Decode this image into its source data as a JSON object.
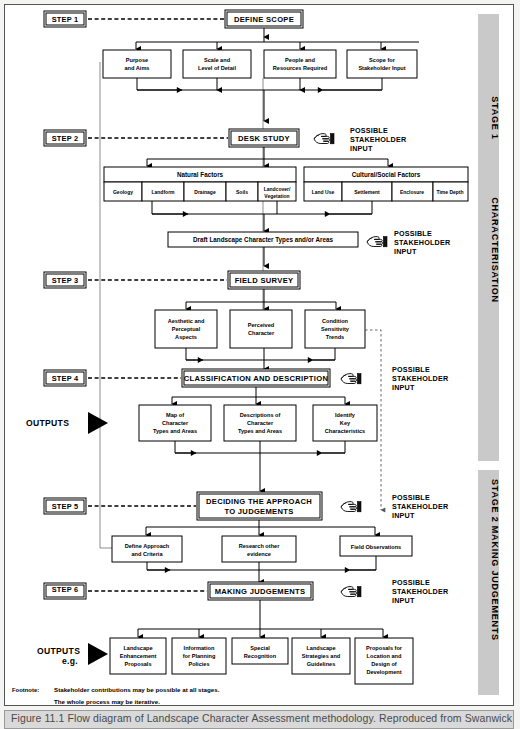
{
  "figure": {
    "caption": "Figure 11.1  Flow diagram of Landscape Character Assessment methodology.  Reproduced from Swanwick &"
  },
  "stages": [
    {
      "id": "stage-1",
      "label": "STAGE 1          CHARACTERISATION"
    },
    {
      "id": "stage-2",
      "label": "STAGE 2 MAKING JUDGEMENTS"
    }
  ],
  "stage_labels": {
    "stage1_a": "STAGE 1",
    "stage1_b": "CHARACTERISATION",
    "stage2": "STAGE 2 MAKING JUDGEMENTS"
  },
  "steps": [
    {
      "id": "step-1",
      "label": "STEP 1",
      "title": "DEFINE SCOPE"
    },
    {
      "id": "step-2",
      "label": "STEP 2",
      "title": "DESK STUDY"
    },
    {
      "id": "step-3",
      "label": "STEP 3",
      "title": "FIELD SURVEY"
    },
    {
      "id": "step-4",
      "label": "STEP 4",
      "title": "CLASSIFICATION AND DESCRIPTION"
    },
    {
      "id": "step-5",
      "label": "STEP 5",
      "title": "DECIDING THE APPROACH TO JUDGEMENTS"
    },
    {
      "id": "step-6",
      "label": "STEP 6",
      "title": "MAKING JUDGEMENTS"
    }
  ],
  "titles": {
    "define_scope": "DEFINE SCOPE",
    "desk_study": "DESK STUDY",
    "field_survey": "FIELD SURVEY",
    "classification": "CLASSIFICATION AND DESCRIPTION",
    "deciding_l1": "DECIDING THE APPROACH",
    "deciding_l2": "TO JUDGEMENTS",
    "making_judgements": "MAKING JUDGEMENTS"
  },
  "step1_boxes": [
    {
      "l1": "Purpose",
      "l2": "and Aims"
    },
    {
      "l1": "Scale and",
      "l2": "Level of Detail"
    },
    {
      "l1": "People and",
      "l2": "Resources Required"
    },
    {
      "l1": "Scope for",
      "l2": "Stakeholder Input"
    }
  ],
  "factors": {
    "natural_header": "Natural Factors",
    "natural_items": [
      {
        "l1": "Geology",
        "l2": ""
      },
      {
        "l1": "Landform",
        "l2": ""
      },
      {
        "l1": "Drainage",
        "l2": ""
      },
      {
        "l1": "Soils",
        "l2": ""
      },
      {
        "l1": "Landcover/",
        "l2": "Vegetation"
      }
    ],
    "cultural_header": "Cultural/Social Factors",
    "cultural_items": [
      {
        "l1": "Land Use",
        "l2": ""
      },
      {
        "l1": "Settlement",
        "l2": ""
      },
      {
        "l1": "Enclosure",
        "l2": ""
      },
      {
        "l1": "Time Depth",
        "l2": ""
      }
    ]
  },
  "draft_box": "Draft Landscape Character Types and/or Areas",
  "step3_boxes": [
    {
      "l1": "Aesthetic and",
      "l2": "Perceptual",
      "l3": "Aspects"
    },
    {
      "l1": "Perceived",
      "l2": "Character",
      "l3": ""
    },
    {
      "l1": "Condition",
      "l2": "Sensitivity",
      "l3": "Trends"
    }
  ],
  "step4_boxes": [
    {
      "l1": "Map of",
      "l2": "Character",
      "l3": "Types and Areas"
    },
    {
      "l1": "Descriptions of",
      "l2": "Character",
      "l3": "Types and Areas"
    },
    {
      "l1": "Identify",
      "l2": "Key",
      "l3": "Characteristics"
    }
  ],
  "step5_boxes": [
    {
      "l1": "Define Approach",
      "l2": "and Criteria"
    },
    {
      "l1": "Research other",
      "l2": "evidence"
    },
    {
      "l1": "Field Observations",
      "l2": ""
    }
  ],
  "step6_boxes": [
    {
      "l1": "Landscape",
      "l2": "Enhancement",
      "l3": "Proposals",
      "l4": ""
    },
    {
      "l1": "Information",
      "l2": "for Planning",
      "l3": "Policies",
      "l4": ""
    },
    {
      "l1": "Special",
      "l2": "Recognition",
      "l3": "",
      "l4": ""
    },
    {
      "l1": "Landscape",
      "l2": "Strategies and",
      "l3": "Guidelines",
      "l4": ""
    },
    {
      "l1": "Proposals for",
      "l2": "Location and",
      "l3": "Design of",
      "l4": "Development"
    }
  ],
  "stakeholder": {
    "line1": "POSSIBLE",
    "line2": "STAKEHOLDER",
    "line3": "INPUT",
    "icon": "pointing-hand-icon",
    "count": 5
  },
  "outputs": {
    "label": "OUTPUTS",
    "eg": "e.g.",
    "marker": "triangle-right-icon"
  },
  "footnote": {
    "label": "Footnote:",
    "line1": "Stakeholder contributions may be possible at all stages.",
    "line2": "The whole process may be iterative."
  },
  "colors": {
    "page_bg": "#f4f4f2",
    "frame_bg": "#ffffff",
    "stage_band": "#c9c9c9",
    "caption_bg": "#d9d9d9",
    "line": "#000000",
    "grey_line": "#8d8d8d"
  }
}
